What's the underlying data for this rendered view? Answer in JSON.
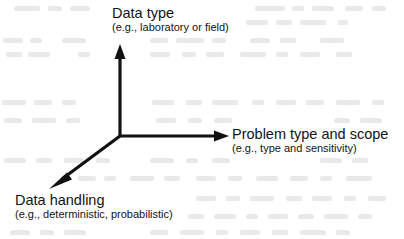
{
  "diagram": {
    "type": "three-axis-concept-diagram",
    "background_color": "#ffffff",
    "line_color": "#111111",
    "line_width_px": 3,
    "origin": {
      "x": 120,
      "y": 136
    },
    "axes": [
      {
        "id": "data-type",
        "direction": "up",
        "title": "Data type",
        "subtitle": "(e.g., laboratory or field)",
        "tip": {
          "x": 120,
          "y": 45
        }
      },
      {
        "id": "problem-type-and-scope",
        "direction": "right",
        "title": "Problem type and scope",
        "subtitle": "(e.g., type and sensitivity)",
        "tip": {
          "x": 228,
          "y": 136
        }
      },
      {
        "id": "data-handling",
        "direction": "down-left",
        "title": "Data handling",
        "subtitle": "(e.g., deterministic, probabilistic)",
        "tip": {
          "x": 50,
          "y": 188
        }
      }
    ]
  }
}
